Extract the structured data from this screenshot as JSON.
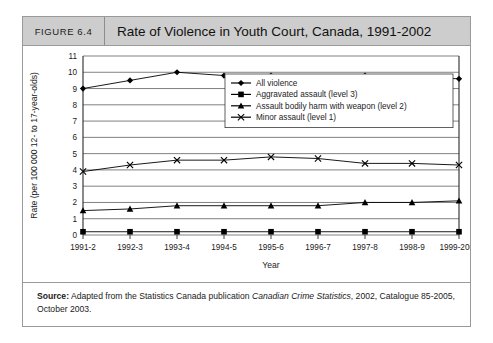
{
  "figure": {
    "number": "FIGURE 6.4",
    "title": "Rate of Violence in Youth Court, Canada, 1991-2002"
  },
  "source": {
    "label": "Source:",
    "text_before": " Adapted from the Statistics Canada publication ",
    "italic": "Canadian Crime Statistics",
    "text_after": ", 2002, Catalogue 85-2005, October 2003."
  },
  "chart_data": {
    "type": "line",
    "title": "Rate of Violence in Youth Court, Canada, 1991-2002",
    "xlabel": "Year",
    "ylabel": "Rate (per 100 000 12- to 17-year-olds)",
    "categories": [
      "1991-2",
      "1992-3",
      "1993-4",
      "1994-5",
      "1995-6",
      "1996-7",
      "1997-8",
      "1998-9",
      "1999-2000"
    ],
    "ylim": [
      0,
      11
    ],
    "yticks": [
      0,
      1,
      2,
      3,
      4,
      5,
      6,
      7,
      8,
      9,
      10,
      11
    ],
    "grid": true,
    "legend_position": "upper-right-inside",
    "series": [
      {
        "name": "All violence",
        "marker": "diamond",
        "values": [
          9.0,
          9.5,
          10.0,
          9.8,
          9.8,
          9.7,
          9.8,
          9.7,
          9.6
        ]
      },
      {
        "name": "Aggravated assault (level 3)",
        "marker": "square",
        "values": [
          0.2,
          0.2,
          0.2,
          0.2,
          0.2,
          0.2,
          0.2,
          0.2,
          0.2
        ]
      },
      {
        "name": "Assault bodily harm with weapon (level 2)",
        "marker": "triangle",
        "values": [
          1.5,
          1.6,
          1.8,
          1.8,
          1.8,
          1.8,
          2.0,
          2.0,
          2.1
        ]
      },
      {
        "name": "Minor assault (level 1)",
        "marker": "cross",
        "values": [
          3.9,
          4.3,
          4.6,
          4.6,
          4.8,
          4.7,
          4.4,
          4.4,
          4.3
        ]
      }
    ]
  }
}
